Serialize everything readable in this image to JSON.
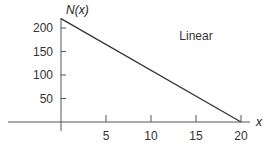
{
  "chart_data": {
    "type": "line",
    "title": "",
    "xlabel": "x",
    "ylabel": "N(x)",
    "xlim": [
      -13,
      22
    ],
    "ylim": [
      -20,
      240
    ],
    "x_ticks": [
      5,
      10,
      15,
      20
    ],
    "x_tick_labels": [
      "5",
      "10",
      "15",
      "20"
    ],
    "y_ticks": [
      50,
      100,
      150,
      200
    ],
    "y_tick_labels": [
      "50",
      "100",
      "150",
      "200"
    ],
    "grid": false,
    "legend": null,
    "annotations": [
      {
        "text": "Linear",
        "x": 15,
        "y": 150
      }
    ],
    "series": [
      {
        "name": "Linear",
        "x": [
          0,
          20
        ],
        "y": [
          220,
          0
        ],
        "color": "#333333"
      }
    ]
  }
}
